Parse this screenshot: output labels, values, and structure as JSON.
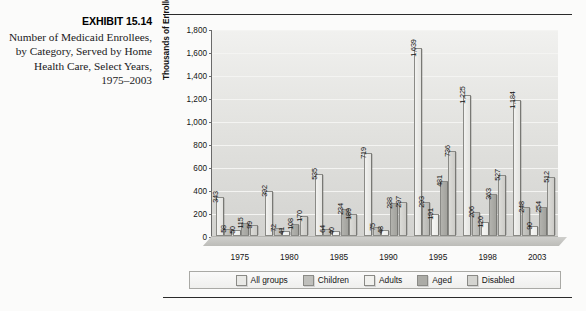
{
  "caption": {
    "exhibit_label": "EXHIBIT 15.14",
    "text": "Number of Medicaid Enrollees, by Category, Served by Home Health Care, Select Years, 1975–2003"
  },
  "chart_data": {
    "type": "bar",
    "title": "",
    "xlabel": "",
    "ylabel": "Thousands of Enrollees",
    "ylim": [
      0,
      1800
    ],
    "yticks": [
      "0",
      "200",
      "400",
      "600",
      "800",
      "1,000",
      "1,200",
      "1,400",
      "1,600",
      "1,800"
    ],
    "grid": true,
    "legend_position": "bottom",
    "categories": [
      "1975",
      "1980",
      "1985",
      "1990",
      "1995",
      "1998",
      "2003"
    ],
    "series": [
      {
        "name": "All groups",
        "color": "#e9e9e6",
        "values": [
          343,
          392,
          535,
          719,
          1639,
          1225,
          1184
        ],
        "labels": [
          "343",
          "392",
          "535",
          "719",
          "1,639",
          "1,225",
          "1,184"
        ]
      },
      {
        "name": "Children",
        "color": "#bfbfbb",
        "values": [
          58,
          72,
          64,
          75,
          293,
          206,
          248
        ],
        "labels": [
          "58",
          "72",
          "64",
          "75",
          "293",
          "206",
          "248"
        ]
      },
      {
        "name": "Adults",
        "color": "#f1f1ee",
        "values": [
          50,
          41,
          40,
          48,
          191,
          120,
          90
        ],
        "labels": [
          "50",
          "41",
          "40",
          "48",
          "191",
          "120",
          "90"
        ]
      },
      {
        "name": "Aged",
        "color": "#ababa6",
        "values": [
          115,
          108,
          234,
          288,
          481,
          363,
          254
        ],
        "labels": [
          "115",
          "108",
          "234",
          "288",
          "481",
          "363",
          "254"
        ]
      },
      {
        "name": "Disabled",
        "color": "#d4d4d0",
        "values": [
          99,
          170,
          189,
          297,
          736,
          527,
          512
        ],
        "labels": [
          "99",
          "170",
          "189",
          "297",
          "736",
          "527",
          "512"
        ]
      }
    ]
  }
}
